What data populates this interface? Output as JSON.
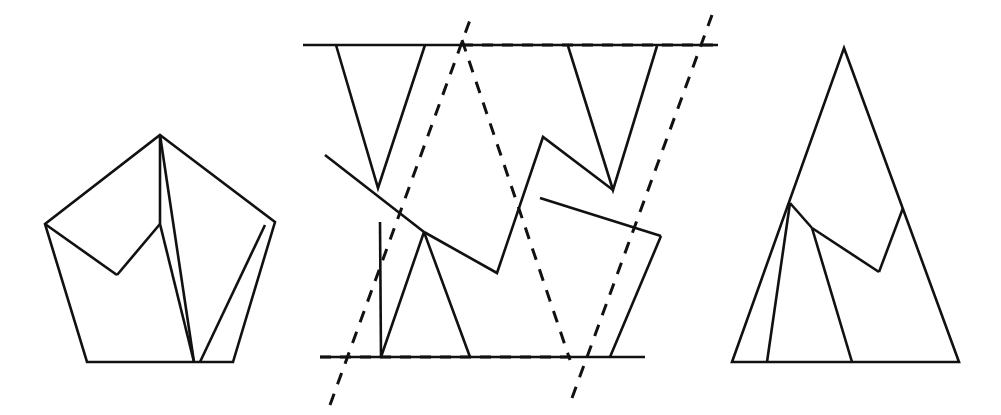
{
  "page": {
    "width": 1001,
    "height": 415,
    "background_color": "#ffffff",
    "ink_color": "#111111",
    "figure_count": 3,
    "caption": ""
  },
  "figures": [
    {
      "id": "figure-left",
      "name": "pentagon-with-zigzag-chords",
      "label": "",
      "description": "Pentagon outline subdivided by interior chords forming a zigzag notch",
      "style": "solid",
      "outline": {
        "name": "pentagon-outline",
        "closed": true,
        "points": [
          [
            160,
            135
          ],
          [
            275,
            222
          ],
          [
            233,
            362
          ],
          [
            87,
            362
          ],
          [
            45,
            224
          ]
        ]
      },
      "chords": [
        {
          "name": "chord-apex-to-notch-left",
          "points": [
            [
              45,
              224
            ],
            [
              117,
              275
            ]
          ]
        },
        {
          "name": "chord-notch-left-to-ridge",
          "points": [
            [
              117,
              275
            ],
            [
              160,
              224
            ]
          ]
        },
        {
          "name": "chord-ridge-to-apex",
          "points": [
            [
              160,
              224
            ],
            [
              160,
              135
            ]
          ]
        },
        {
          "name": "chord-apex-to-base-vee",
          "points": [
            [
              160,
              135
            ],
            [
              194,
              362
            ]
          ]
        },
        {
          "name": "chord-ridge-to-base-vee",
          "points": [
            [
              160,
              224
            ],
            [
              194,
              362
            ]
          ]
        },
        {
          "name": "chord-right-vertex-to-base-vee",
          "points": [
            [
              265,
              225
            ],
            [
              200,
              362
            ]
          ]
        }
      ]
    },
    {
      "id": "figure-middle",
      "name": "zigzag-band-with-dashed-parallels",
      "label": "",
      "description": "Two horizontal rails with solid zigzag polylines and two steep dashed parallel lines overlaid",
      "style": "mixed-solid-dashed",
      "rails": [
        {
          "name": "rail-top",
          "points": [
            [
              303,
              45
            ],
            [
              718,
              45
            ]
          ]
        },
        {
          "name": "rail-bottom",
          "points": [
            [
              320,
              357
            ],
            [
              645,
              357
            ]
          ]
        }
      ],
      "dashed_overlays": [
        {
          "name": "dashed-rail-top-segment",
          "points": [
            [
              462,
              45
            ],
            [
              718,
              45
            ]
          ]
        },
        {
          "name": "dashed-rail-bottom-segment",
          "points": [
            [
              320,
              357
            ],
            [
              578,
              357
            ]
          ]
        },
        {
          "name": "dashed-steep-left",
          "points": [
            [
              330,
              405
            ],
            [
              470,
              20
            ]
          ]
        },
        {
          "name": "dashed-steep-right",
          "points": [
            [
              572,
              398
            ],
            [
              712,
              15
            ]
          ]
        },
        {
          "name": "dashed-chevron",
          "points": [
            [
              462,
              40
            ],
            [
              570,
              360
            ]
          ]
        }
      ],
      "solid_polylines": [
        {
          "name": "vee-upper-left",
          "points": [
            [
              336,
              45
            ],
            [
              378,
              188
            ],
            [
              425,
              45
            ]
          ]
        },
        {
          "name": "vee-upper-right",
          "points": [
            [
              568,
              46
            ],
            [
              613,
              190
            ],
            [
              657,
              46
            ]
          ]
        },
        {
          "name": "slant-line-left",
          "points": [
            [
              325,
              155
            ],
            [
              424,
              232
            ]
          ]
        },
        {
          "name": "slant-line-right",
          "points": [
            [
              540,
              198
            ],
            [
              661,
              236
            ]
          ]
        },
        {
          "name": "zigzag-center",
          "points": [
            [
              424,
              232
            ],
            [
              497,
              273
            ],
            [
              543,
              137
            ],
            [
              613,
              190
            ]
          ]
        },
        {
          "name": "vee-lower-left",
          "points": [
            [
              380,
              222
            ],
            [
              381,
              357
            ]
          ]
        },
        {
          "name": "triangle-lower-left",
          "points": [
            [
              424,
              232
            ],
            [
              381,
              357
            ],
            [
              470,
              357
            ],
            [
              424,
              232
            ]
          ]
        },
        {
          "name": "post-lower-right",
          "points": [
            [
              610,
              357
            ],
            [
              661,
              236
            ]
          ]
        }
      ]
    },
    {
      "id": "figure-right",
      "name": "triangle-with-zigzag-chords",
      "label": "",
      "description": "Tall isosceles triangle subdivided by interior chords forming a zigzag notch",
      "style": "solid",
      "outline": {
        "name": "triangle-outline",
        "closed": true,
        "points": [
          [
            844,
            48
          ],
          [
            959,
            362
          ],
          [
            732,
            362
          ]
        ]
      },
      "chords": [
        {
          "name": "chord-left-edge-to-ridge",
          "points": [
            [
              790,
              203
            ],
            [
              812,
              228
            ]
          ]
        },
        {
          "name": "chord-ridge-to-notch",
          "points": [
            [
              812,
              228
            ],
            [
              879,
              272
            ]
          ]
        },
        {
          "name": "chord-notch-to-right-edge",
          "points": [
            [
              879,
              272
            ],
            [
              903,
              208
            ]
          ]
        },
        {
          "name": "chord-left-edge-to-base",
          "points": [
            [
              790,
              203
            ],
            [
              767,
              362
            ]
          ]
        },
        {
          "name": "chord-ridge-to-base",
          "points": [
            [
              812,
              228
            ],
            [
              852,
              362
            ]
          ]
        }
      ]
    }
  ],
  "legend": {
    "visible": false,
    "entries": []
  },
  "annotations": {
    "visible": false,
    "items": []
  },
  "chart_data": {
    "type": "line",
    "title": "",
    "xlabel": "",
    "ylabel": "",
    "series": []
  }
}
